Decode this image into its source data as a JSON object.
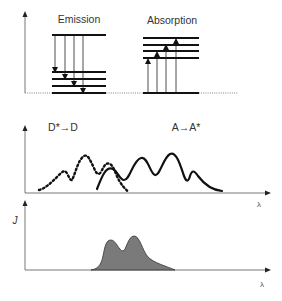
{
  "figure": {
    "top_panel": {
      "emission_label": "Emission",
      "absorption_label": "Absorption"
    },
    "middle_panel": {
      "donor_label": "D*→D",
      "acceptor_label": "A→A*",
      "x_axis_label": "λ"
    },
    "bottom_panel": {
      "y_axis_label": "J",
      "x_axis_label": "λ",
      "fill_color": "#7a7a7a"
    }
  }
}
